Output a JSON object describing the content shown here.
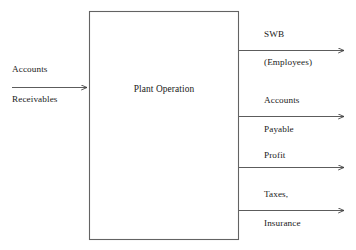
{
  "diagram": {
    "type": "block-flow-diagram",
    "process_box": {
      "label": "Plant Operation",
      "x": 89,
      "y": 11,
      "width": 150,
      "height": 229,
      "stroke_color": "#555555",
      "fill_color": "#ffffff"
    },
    "inputs": [
      {
        "name": "accounts-receivable-input",
        "label_above": "Accounts",
        "label_below": "Receivables",
        "arrow_y": 87,
        "arrow_x_start": 12,
        "arrow_x_end": 89
      }
    ],
    "outputs": [
      {
        "name": "swb-employees-output",
        "label_above": "SWB",
        "label_below": "(Employees)",
        "arrow_y": 50,
        "arrow_x_start": 239,
        "arrow_x_end": 346
      },
      {
        "name": "accounts-payable-output",
        "label_above": "Accounts",
        "label_below": "Payable",
        "arrow_y": 116,
        "arrow_x_start": 239,
        "arrow_x_end": 346
      },
      {
        "name": "profit-output",
        "label_above": "Profit",
        "label_below": "",
        "arrow_y": 167,
        "arrow_x_start": 239,
        "arrow_x_end": 346
      },
      {
        "name": "taxes-insurance-output",
        "label_above": "Taxes,",
        "label_below": "Insurance",
        "arrow_y": 210,
        "arrow_x_start": 239,
        "arrow_x_end": 346
      }
    ],
    "colors": {
      "line": "#4a4a4a",
      "text": "#1a1a1a",
      "background": "#ffffff"
    }
  }
}
